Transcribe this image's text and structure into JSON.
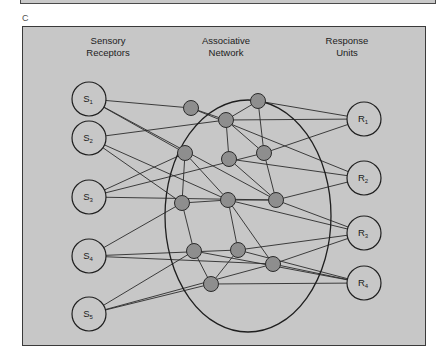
{
  "figure": {
    "panel_letter": "C",
    "colors": {
      "panel_background": "#c7c7c7",
      "panel_border": "#3a3a3a",
      "io_node_fill": "#c7c7c7",
      "io_node_stroke": "#1f1f1f",
      "interior_node_fill": "#8e8e8e",
      "interior_node_stroke": "#2a2a2a",
      "edge_stroke": "#2b2b2b",
      "boundary_stroke": "#1f1f1f"
    },
    "columns": [
      {
        "id": "sensory",
        "label": "Sensory\nReceptors"
      },
      {
        "id": "assoc",
        "label": "Associative\nNetwork"
      },
      {
        "id": "response",
        "label": "Response\nUnits"
      }
    ]
  },
  "chart_data": {
    "type": "diagram",
    "layers": [
      "Sensory Receptors",
      "Associative Network",
      "Response Units"
    ],
    "sensory_nodes": [
      {
        "id": "S1",
        "base": "S",
        "sub": "1",
        "x": 66,
        "y": 72,
        "r": 17
      },
      {
        "id": "S2",
        "base": "S",
        "sub": "2",
        "x": 66,
        "y": 111,
        "r": 17
      },
      {
        "id": "S3",
        "base": "S",
        "sub": "3",
        "x": 66,
        "y": 170,
        "r": 17
      },
      {
        "id": "S4",
        "base": "S",
        "sub": "4",
        "x": 66,
        "y": 229,
        "r": 17
      },
      {
        "id": "S5",
        "base": "S",
        "sub": "5",
        "x": 66,
        "y": 287,
        "r": 17
      }
    ],
    "response_nodes": [
      {
        "id": "R1",
        "base": "R",
        "sub": "1",
        "x": 341,
        "y": 92,
        "r": 17
      },
      {
        "id": "R2",
        "base": "R",
        "sub": "2",
        "x": 341,
        "y": 151,
        "r": 17
      },
      {
        "id": "R3",
        "base": "R",
        "sub": "3",
        "x": 341,
        "y": 206,
        "r": 17
      },
      {
        "id": "R4",
        "base": "R",
        "sub": "4",
        "x": 341,
        "y": 256,
        "r": 17
      }
    ],
    "interior_nodes": [
      {
        "id": "A1",
        "x": 168,
        "y": 81,
        "r": 7.5
      },
      {
        "id": "A2",
        "x": 203,
        "y": 93,
        "r": 7.5
      },
      {
        "id": "A3",
        "x": 235,
        "y": 74,
        "r": 7.5
      },
      {
        "id": "A4",
        "x": 162,
        "y": 126,
        "r": 7.5
      },
      {
        "id": "A5",
        "x": 206,
        "y": 132,
        "r": 7.5
      },
      {
        "id": "A6",
        "x": 241,
        "y": 126,
        "r": 7.5
      },
      {
        "id": "A7",
        "x": 159,
        "y": 176,
        "r": 7.5
      },
      {
        "id": "A8",
        "x": 205,
        "y": 173,
        "r": 7.5
      },
      {
        "id": "A9",
        "x": 253,
        "y": 173,
        "r": 7.5
      },
      {
        "id": "A10",
        "x": 171,
        "y": 224,
        "r": 7.5
      },
      {
        "id": "A11",
        "x": 215,
        "y": 223,
        "r": 7.5
      },
      {
        "id": "A12",
        "x": 250,
        "y": 237,
        "r": 7.5
      },
      {
        "id": "A13",
        "x": 188,
        "y": 257,
        "r": 7.5
      }
    ],
    "boundary": {
      "shape": "ellipse",
      "cx": 225,
      "cy": 189,
      "rx": 83,
      "ry": 116
    },
    "internal_edges": [
      [
        "A1",
        "A2"
      ],
      [
        "A2",
        "A3"
      ],
      [
        "A2",
        "A5"
      ],
      [
        "A3",
        "A6"
      ],
      [
        "A2",
        "A6"
      ],
      [
        "A4",
        "A8"
      ],
      [
        "A5",
        "A9"
      ],
      [
        "A6",
        "A9"
      ],
      [
        "A7",
        "A8"
      ],
      [
        "A8",
        "A9"
      ],
      [
        "A7",
        "A10"
      ],
      [
        "A8",
        "A11"
      ],
      [
        "A10",
        "A13"
      ],
      [
        "A11",
        "A13"
      ],
      [
        "A8",
        "A12"
      ],
      [
        "A4",
        "A7"
      ]
    ],
    "sensory_edges": [
      [
        "S1",
        "A1"
      ],
      [
        "S1",
        "A4"
      ],
      [
        "S1",
        "A9"
      ],
      [
        "S2",
        "A2"
      ],
      [
        "S2",
        "A7"
      ],
      [
        "S2",
        "A8"
      ],
      [
        "S3",
        "A4"
      ],
      [
        "S3",
        "A6"
      ],
      [
        "S3",
        "A9"
      ],
      [
        "S4",
        "A7"
      ],
      [
        "S4",
        "A11"
      ],
      [
        "S4",
        "A12"
      ],
      [
        "S5",
        "A10"
      ],
      [
        "S5",
        "A13"
      ],
      [
        "S5",
        "A12"
      ]
    ],
    "response_edges": [
      [
        "A3",
        "R1"
      ],
      [
        "A6",
        "R1"
      ],
      [
        "A2",
        "R1"
      ],
      [
        "A9",
        "R2"
      ],
      [
        "A5",
        "R2"
      ],
      [
        "A1",
        "R2"
      ],
      [
        "A12",
        "R3"
      ],
      [
        "A11",
        "R3"
      ],
      [
        "A9",
        "R3"
      ],
      [
        "A8",
        "R3"
      ],
      [
        "A13",
        "R4"
      ],
      [
        "A12",
        "R4"
      ],
      [
        "A11",
        "R4"
      ],
      [
        "A10",
        "R4"
      ]
    ]
  }
}
